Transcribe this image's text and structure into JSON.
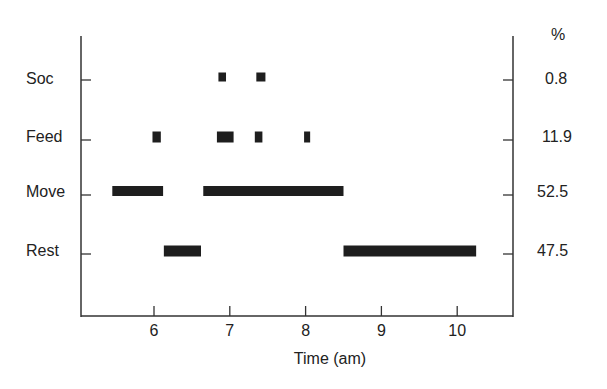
{
  "chart_data": {
    "type": "timeline",
    "title": "",
    "xlabel": "Time (am)",
    "ylabel": "",
    "xlim": [
      5.0,
      10.75
    ],
    "x_ticks": [
      6,
      7,
      8,
      9,
      10
    ],
    "x_tick_labels": [
      "6",
      "7",
      "8",
      "9",
      "10"
    ],
    "grid": false,
    "right_axis_header": "%",
    "categories": [
      "Soc",
      "Feed",
      "Move",
      "Rest"
    ],
    "series": [
      {
        "name": "Soc",
        "percent": "0.8",
        "intervals": [
          [
            6.85,
            6.95
          ],
          [
            7.35,
            7.47
          ]
        ]
      },
      {
        "name": "Feed",
        "percent": "11.9",
        "intervals": [
          [
            5.98,
            6.09
          ],
          [
            6.83,
            7.05
          ],
          [
            7.33,
            7.43
          ],
          [
            7.98,
            8.06
          ]
        ]
      },
      {
        "name": "Move",
        "percent": "52.5",
        "intervals": [
          [
            5.45,
            6.12
          ],
          [
            6.65,
            8.5
          ]
        ]
      },
      {
        "name": "Rest",
        "percent": "47.5",
        "intervals": [
          [
            6.13,
            6.62
          ],
          [
            8.5,
            10.25
          ]
        ]
      }
    ]
  },
  "labels": {
    "rows": [
      "Soc",
      "Feed",
      "Move",
      "Rest"
    ],
    "percents": [
      "0.8",
      "11.9",
      "52.5",
      "47.5"
    ],
    "percent_header": "%",
    "x_title": "Time (am)",
    "x_ticks": [
      "6",
      "7",
      "8",
      "9",
      "10"
    ]
  }
}
